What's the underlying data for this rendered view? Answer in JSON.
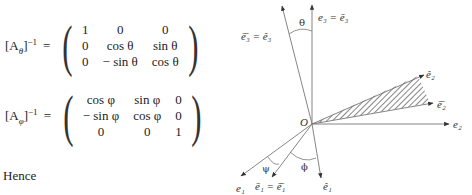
{
  "equations": [
    {
      "lhs_base": "[A",
      "lhs_sub": "θ",
      "lhs_close": "]",
      "lhs_exp": "−1",
      "eq": "=",
      "matrix": [
        [
          "1",
          "0",
          "0"
        ],
        [
          "0",
          "cos θ",
          "sin θ"
        ],
        [
          "0",
          "− sin θ",
          "cos θ"
        ]
      ]
    },
    {
      "lhs_base": "[A",
      "lhs_sub": "φ",
      "lhs_close": "]",
      "lhs_exp": "−1",
      "eq": "=",
      "matrix": [
        [
          "cos φ",
          "sin φ",
          "0"
        ],
        [
          "− sin φ",
          "cos φ",
          "0"
        ],
        [
          "0",
          "0",
          "1"
        ]
      ]
    }
  ],
  "hence_text": "Hence",
  "diagram": {
    "origin_label": "O",
    "angles": {
      "theta": "θ",
      "phi": "ϕ",
      "psi": "ψ"
    },
    "labels": {
      "e3_eq": "e₃ = ē₃",
      "e3bar_eq": "ē̄₃ = ê₃",
      "e2hat": "ê₂",
      "e2bbar": "ē̄₂",
      "e2": "e₂",
      "e1": "e₁",
      "e1bar_eq": "ē₁ = ē̄₁",
      "e1hat": "ê₁"
    },
    "colors": {
      "line": "#555555",
      "hatch": "#444444"
    }
  }
}
